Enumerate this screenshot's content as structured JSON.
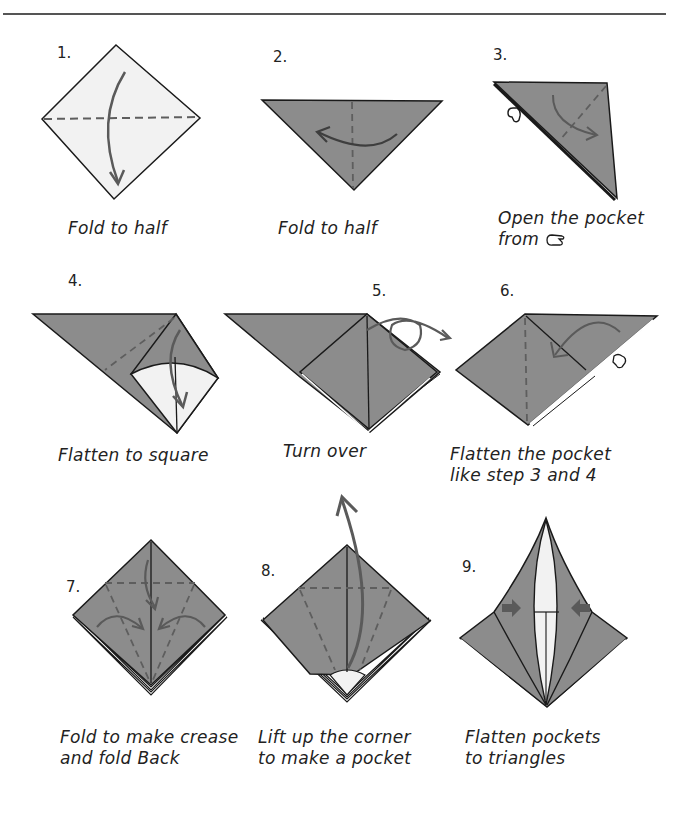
{
  "colors": {
    "paper_white": "#f2f2f2",
    "paper_gray": "#8c8c8c",
    "outline": "#1a1a1a",
    "arrow": "#5a5a5a",
    "crease": "#5e5e5e"
  },
  "steps": [
    {
      "number": "1.",
      "caption_lines": [
        "Fold to half"
      ]
    },
    {
      "number": "2.",
      "caption_lines": [
        "Fold to half"
      ]
    },
    {
      "number": "3.",
      "caption_lines": [
        "Open the pocket",
        "from"
      ],
      "icon": "pointing-hand-icon"
    },
    {
      "number": "4.",
      "caption_lines": [
        "Flatten to square"
      ]
    },
    {
      "number": "5.",
      "caption_lines": [
        "Turn over"
      ]
    },
    {
      "number": "6.",
      "caption_lines": [
        "Flatten the pocket",
        "like step 3 and 4"
      ]
    },
    {
      "number": "7.",
      "caption_lines": [
        "Fold to make crease",
        "and fold Back"
      ]
    },
    {
      "number": "8.",
      "caption_lines": [
        "Lift up the corner",
        "to make a pocket"
      ]
    },
    {
      "number": "9.",
      "caption_lines": [
        "Flatten pockets",
        "to triangles"
      ]
    }
  ]
}
